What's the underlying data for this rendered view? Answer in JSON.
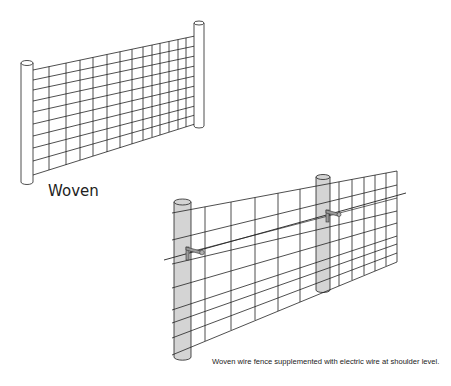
{
  "figure": {
    "panels": [
      {
        "id": "woven",
        "label": "Woven",
        "description": "Plain woven wire fence between two posts"
      },
      {
        "id": "woven-electric",
        "caption": "Woven wire fence supplemented with electric wire at shoulder level.",
        "description": "Woven wire fence on two posts with an electric wire on offset insulators"
      }
    ],
    "colors": {
      "line": "#222222",
      "post_fill": "#d4d4d4",
      "post_fill_plain": "#ffffff",
      "bracket": "#9a9a9a",
      "background": "#ffffff"
    }
  }
}
